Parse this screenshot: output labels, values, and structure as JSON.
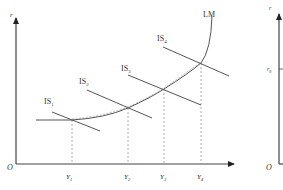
{
  "diagram": {
    "type": "IS-LM diagram",
    "left_panel": {
      "y_axis_label": "r",
      "origin_label": "O",
      "curves": {
        "lm": {
          "label": "LM"
        },
        "is": [
          {
            "label": "IS",
            "sub": "1"
          },
          {
            "label": "IS",
            "sub": "2"
          },
          {
            "label": "IS",
            "sub": "3"
          },
          {
            "label": "IS",
            "sub": "4"
          }
        ]
      },
      "x_ticks": [
        {
          "label": "Y",
          "sub": "1"
        },
        {
          "label": "Y",
          "sub": "2"
        },
        {
          "label": "Y",
          "sub": "3"
        },
        {
          "label": "Y",
          "sub": "4"
        }
      ]
    },
    "right_panel": {
      "y_axis_label": "r",
      "tick_label": "r",
      "tick_sub": "0",
      "origin_label": "O"
    }
  },
  "colors": {
    "axis": "#333333",
    "curve": "#555555",
    "dashed": "#888888"
  }
}
